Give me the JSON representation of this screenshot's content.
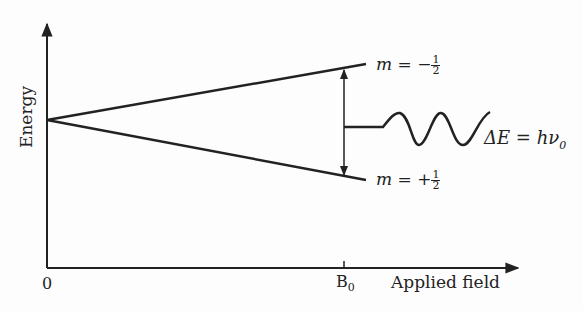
{
  "diagram": {
    "type": "energy-level-splitting",
    "y_axis_label": "Energy",
    "x_axis_label": "Applied field",
    "origin_label": "0",
    "field_marker": {
      "label": "B",
      "subscript": "0"
    },
    "levels": [
      {
        "name": "upper",
        "m_label": "m = ",
        "sign": "−",
        "num": "1",
        "den": "2"
      },
      {
        "name": "lower",
        "m_label": "m = ",
        "sign": "+",
        "num": "1",
        "den": "2"
      }
    ],
    "transition": {
      "label_prefix": "ΔE = hν",
      "subscript": "0"
    },
    "colors": {
      "line": "#222222",
      "background": "#fdfdfd"
    }
  }
}
